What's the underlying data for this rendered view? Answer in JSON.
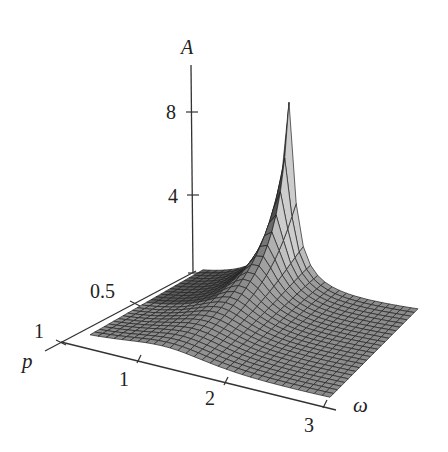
{
  "chart_data": {
    "type": "surface3d",
    "title": "",
    "function": "A(p, omega) = 1 / sqrt((1 - (omega/omega0)^2)^2 + (p*omega/omega0)^2)",
    "params": {
      "omega0": 1.25,
      "clip_max": 10.2
    },
    "x": {
      "name": "omega",
      "label": "ω",
      "range": [
        0.1,
        3
      ],
      "ticks": [
        1,
        2,
        3
      ],
      "tick_labels": [
        "1",
        "2",
        "3"
      ]
    },
    "y": {
      "name": "p",
      "label": "p",
      "range": [
        0.1,
        1
      ],
      "ticks": [
        0.5,
        1
      ],
      "tick_labels": [
        "0.5",
        "1"
      ]
    },
    "z": {
      "name": "A",
      "label": "A",
      "range": [
        0,
        10
      ],
      "ticks": [
        4,
        8
      ],
      "tick_labels": [
        "4",
        "8"
      ]
    },
    "grid": {
      "omega_steps": 30,
      "p_steps": 24
    },
    "peak": {
      "p": 0.1,
      "omega": 1.25,
      "A_clipped": 10
    },
    "grid_on": false,
    "legend": null
  },
  "labels": {
    "A_axis": "A",
    "p_axis": "p",
    "omega_axis": "ω",
    "tick_8": "8",
    "tick_4": "4",
    "tick_05": "0.5",
    "tick_p1": "1",
    "tick_w1": "1",
    "tick_w2": "2",
    "tick_w3": "3"
  }
}
